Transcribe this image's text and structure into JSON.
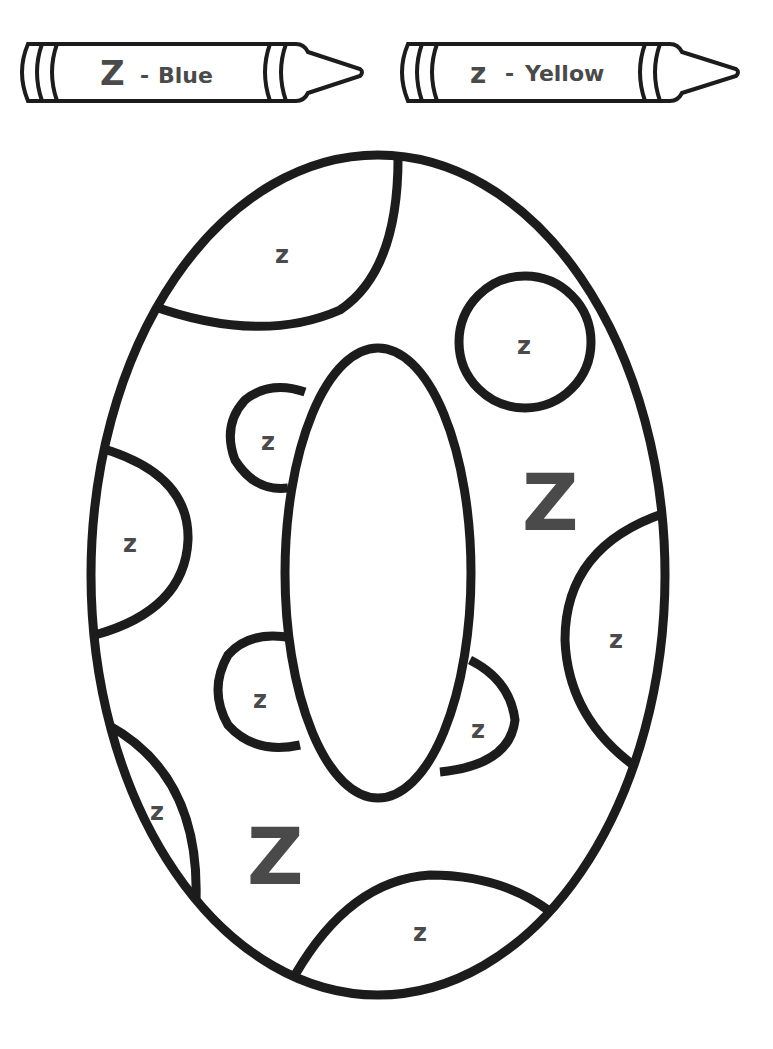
{
  "worksheet": {
    "type": "color-by-letter coloring page",
    "shape": "letter O"
  },
  "legend": [
    {
      "letter": "Z",
      "dash": "-",
      "color_name": "Blue",
      "hint_color": "#3a6fd8"
    },
    {
      "letter": "z",
      "dash": "-",
      "color_name": "Yellow",
      "hint_color": "#f2d230"
    }
  ],
  "regions": {
    "uppercase_label": "Z",
    "lowercase_label": "z"
  },
  "colors": {
    "outline": "#1c1c1c",
    "label": "#4a4a4a",
    "background": "#ffffff"
  }
}
